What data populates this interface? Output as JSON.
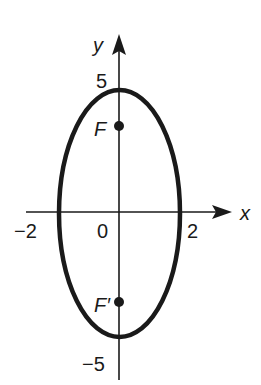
{
  "diagram": {
    "type": "ellipse-on-axes",
    "equation_hint": "vertical ellipse centered at origin, foci on y-axis",
    "axes": {
      "x_label": "x",
      "y_label": "y",
      "x_ticks": [
        {
          "value": -2,
          "label": "−2"
        },
        {
          "value": 2,
          "label": "2"
        }
      ],
      "y_ticks": [
        {
          "value": 5,
          "label": "5"
        },
        {
          "value": -5,
          "label": "−5"
        }
      ],
      "origin_label": "0"
    },
    "ellipse": {
      "center": [
        0,
        0
      ],
      "semi_major_vertical": 5,
      "semi_minor_horizontal": 2
    },
    "foci": [
      {
        "label": "F",
        "position": "upper",
        "y": 3.6
      },
      {
        "label": "F′",
        "position": "lower",
        "y": -3.6
      }
    ],
    "colors": {
      "stroke": "#1a1a1a",
      "background": "#ffffff"
    }
  }
}
